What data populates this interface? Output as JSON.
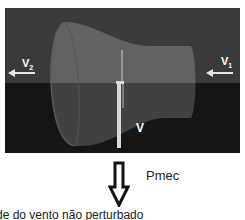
{
  "diagram": {
    "labels": {
      "v_upstream": "V",
      "v_upstream_sub": "1",
      "v_downstream": "V",
      "v_downstream_sub": "2",
      "v_rotor": "V",
      "power": "Pmec",
      "caption": "de do vento não perturbado"
    },
    "colors": {
      "sky": "#3a3a3a",
      "ground": "#1e1e1e",
      "tube_top": "#6e6e6e",
      "tube_bottom": "#4a4a4a",
      "arrow": "#e6e6e6",
      "tower": "#d9d9d9",
      "power_arrow": "#111111"
    },
    "arrows": [
      {
        "name": "upstream-wind",
        "direction": "left",
        "label": "V1"
      },
      {
        "name": "downstream-wind",
        "direction": "left",
        "label": "V2"
      },
      {
        "name": "mechanical-power",
        "direction": "down",
        "label": "Pmec"
      }
    ]
  }
}
